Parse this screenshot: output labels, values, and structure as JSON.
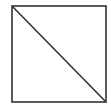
{
  "diagram": {
    "background": "#ffffff",
    "stroke_color": "#333333",
    "stroke_width": 1.6,
    "square": {
      "x": 12,
      "y": 6,
      "width": 94,
      "height": 96
    },
    "diagonal": {
      "x1": 12,
      "y1": 6,
      "x2": 106,
      "y2": 102
    }
  }
}
